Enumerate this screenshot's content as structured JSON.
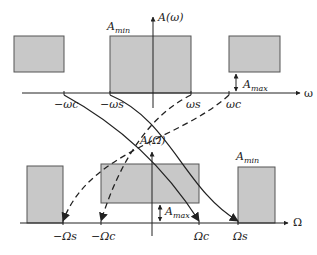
{
  "diagram": {
    "type": "filter-frequency-transformation",
    "top_plot": {
      "y_axis_label": "A(ω)",
      "x_axis_label": "ω",
      "ticks": [
        "−ωc",
        "−ωs",
        "ωs",
        "ωc"
      ],
      "labels": {
        "amin": "A",
        "amin_sub": "min",
        "amax": "A",
        "amax_sub": "max"
      }
    },
    "bottom_plot": {
      "y_axis_label": "A(Ω)",
      "x_axis_label": "Ω",
      "ticks": [
        "−Ωs",
        "−Ωc",
        "Ωc",
        "Ωs"
      ],
      "labels": {
        "amin": "A",
        "amin_sub": "min",
        "amax": "A",
        "amax_sub": "max"
      }
    },
    "colors": {
      "box_fill": "#c8c8c8",
      "box_stroke": "#555555",
      "line": "#222222"
    }
  }
}
